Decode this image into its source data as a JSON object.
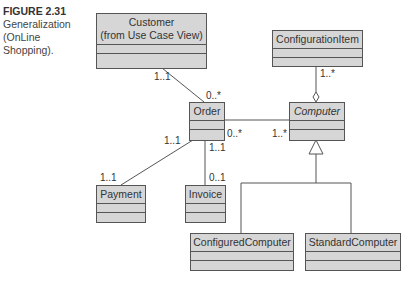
{
  "caption": {
    "figure": "FIGURE 2.31",
    "lines": [
      "Generalization",
      "(OnLine",
      "Shopping)."
    ]
  },
  "classes": {
    "customer": {
      "name_line1": "Customer",
      "name_line2": "(from Use Case View)"
    },
    "configuration_item": {
      "name": "ConfigurationItem"
    },
    "order": {
      "name": "Order"
    },
    "computer": {
      "name": "Computer",
      "abstract": true
    },
    "payment": {
      "name": "Payment"
    },
    "invoice": {
      "name": "Invoice"
    },
    "configured_computer": {
      "name": "ConfiguredComputer"
    },
    "standard_computer": {
      "name": "StandardComputer"
    }
  },
  "multiplicities": {
    "customer_order_customer": "1..1",
    "customer_order_order": "0..*",
    "configitem_computer": "1..*",
    "order_computer_order": "0..*",
    "order_computer_computer": "1..*",
    "order_payment_order": "1..1",
    "order_payment_payment": "1..1",
    "order_invoice_order": "1..1",
    "order_invoice_invoice": "0..1"
  },
  "colors": {
    "box_fill": "#d6d6d6",
    "line": "#555555",
    "text": "#333333"
  }
}
